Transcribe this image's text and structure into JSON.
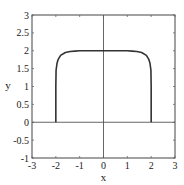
{
  "chart_data": {
    "type": "line",
    "title": "",
    "xlabel": "x",
    "ylabel": "y",
    "xlim": [
      -3,
      3
    ],
    "ylim": [
      -1,
      3
    ],
    "xticks": [
      -3,
      -2,
      -1,
      0,
      1,
      2,
      3
    ],
    "yticks": [
      -1,
      -0.5,
      0,
      0.5,
      1,
      1.5,
      2,
      2.5,
      3
    ],
    "xtick_labels": [
      "-3",
      "-2",
      "-1",
      "0",
      "1",
      "2",
      "3"
    ],
    "ytick_labels": [
      "-1",
      "-0.5",
      "0",
      "0.5",
      "1",
      "1.5",
      "2",
      "2.5",
      "3"
    ],
    "grid": false,
    "zero_lines": true,
    "series": [
      {
        "name": "curve",
        "color": "#333333",
        "x": [
          -2,
          -2,
          -1.99,
          -1.95,
          -1.9,
          -1.8,
          -1.6,
          -1.4,
          -1.2,
          -1.0,
          -0.5,
          0,
          0.5,
          1.0,
          1.2,
          1.4,
          1.6,
          1.8,
          1.9,
          1.95,
          1.99,
          2,
          2
        ],
        "y": [
          0,
          1.0,
          1.45,
          1.65,
          1.76,
          1.87,
          1.95,
          1.98,
          1.99,
          2.0,
          2.0,
          2.0,
          2.0,
          2.0,
          1.99,
          1.98,
          1.95,
          1.87,
          1.76,
          1.65,
          1.45,
          1.0,
          0
        ]
      }
    ]
  }
}
